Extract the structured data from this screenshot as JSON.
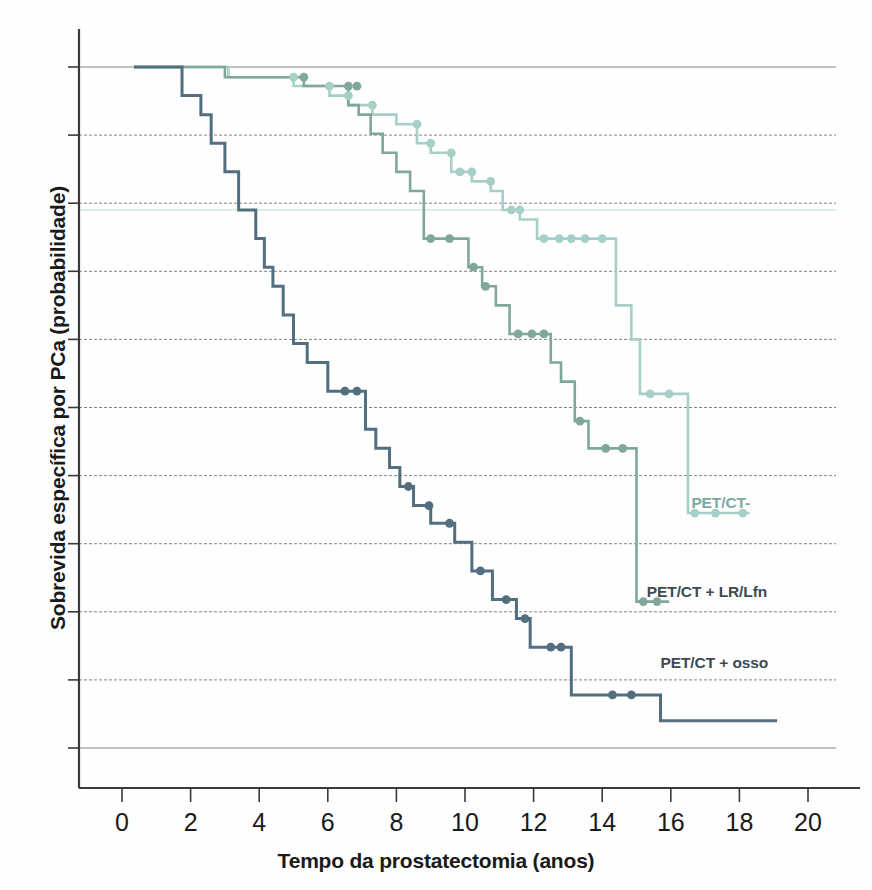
{
  "chart_data": {
    "type": "line",
    "title": "",
    "subtitle": "",
    "xlabel": "Tempo da prostatectomia (anos)",
    "ylabel": "Sobrevida específica por PCa (probabilidade)",
    "xlim": [
      -0.65,
      20.6
    ],
    "ylim": [
      0.0,
      1.06
    ],
    "xticks": [
      0,
      2,
      4,
      6,
      8,
      10,
      12,
      14,
      16,
      18,
      20
    ],
    "xtick_labels": [
      "0",
      "2",
      "4",
      "6",
      "8",
      "10",
      "12",
      "14",
      "16",
      "18",
      "20"
    ],
    "yticks": [
      0.0,
      0.1,
      0.2,
      0.3,
      0.4,
      0.5,
      0.6,
      0.7,
      0.8,
      0.9,
      1.0
    ],
    "ytick_labels": [
      "",
      "",
      "",
      "",
      "",
      "",
      "",
      "",
      "",
      "",
      ""
    ],
    "grid": true,
    "grid_style": "dashed-horizontal",
    "legend_position": "inline-right-of-curves",
    "curve_style": "kaplan-meier step function with censoring dots",
    "series": [
      {
        "name": "PET/CT-",
        "color": "#a6d0c7",
        "label_color": "#7ba99f",
        "label_x": 16.6,
        "label_y": 0.345,
        "points": [
          [
            0.35,
            1.0
          ],
          [
            3.1,
            1.0
          ],
          [
            3.1,
            0.985
          ],
          [
            5.0,
            0.985
          ],
          [
            5.0,
            0.972
          ],
          [
            6.05,
            0.972
          ],
          [
            6.05,
            0.958
          ],
          [
            6.6,
            0.958
          ],
          [
            6.6,
            0.944
          ],
          [
            7.3,
            0.944
          ],
          [
            7.3,
            0.93
          ],
          [
            8.0,
            0.93
          ],
          [
            8.0,
            0.916
          ],
          [
            8.6,
            0.916
          ],
          [
            8.6,
            0.888
          ],
          [
            9.0,
            0.888
          ],
          [
            9.0,
            0.874
          ],
          [
            9.6,
            0.874
          ],
          [
            9.6,
            0.846
          ],
          [
            10.2,
            0.846
          ],
          [
            10.2,
            0.832
          ],
          [
            10.75,
            0.832
          ],
          [
            10.75,
            0.818
          ],
          [
            11.1,
            0.818
          ],
          [
            11.1,
            0.79
          ],
          [
            11.6,
            0.79
          ],
          [
            11.6,
            0.776
          ],
          [
            12.1,
            0.776
          ],
          [
            12.1,
            0.748
          ],
          [
            14.4,
            0.748
          ],
          [
            14.4,
            0.65
          ],
          [
            14.85,
            0.65
          ],
          [
            14.85,
            0.6
          ],
          [
            15.1,
            0.6
          ],
          [
            15.1,
            0.52
          ],
          [
            16.5,
            0.52
          ],
          [
            16.5,
            0.345
          ],
          [
            18.3,
            0.345
          ]
        ],
        "censor_marks": [
          [
            5.0,
            0.985
          ],
          [
            6.05,
            0.972
          ],
          [
            6.6,
            0.958
          ],
          [
            7.3,
            0.944
          ],
          [
            8.6,
            0.916
          ],
          [
            9.0,
            0.888
          ],
          [
            9.6,
            0.874
          ],
          [
            9.85,
            0.846
          ],
          [
            10.2,
            0.846
          ],
          [
            10.75,
            0.832
          ],
          [
            11.35,
            0.79
          ],
          [
            11.6,
            0.79
          ],
          [
            12.3,
            0.748
          ],
          [
            12.75,
            0.748
          ],
          [
            13.1,
            0.748
          ],
          [
            13.5,
            0.748
          ],
          [
            14.0,
            0.748
          ],
          [
            15.4,
            0.52
          ],
          [
            15.95,
            0.52
          ],
          [
            16.7,
            0.345
          ],
          [
            17.3,
            0.345
          ],
          [
            18.1,
            0.345
          ]
        ]
      },
      {
        "name": "PET/CT + LR/Lfn",
        "color": "#7fa79b",
        "label_color": "#3c4a52",
        "label_x": 15.3,
        "label_y": 0.215,
        "points": [
          [
            0.35,
            1.0
          ],
          [
            3.0,
            1.0
          ],
          [
            3.0,
            0.985
          ],
          [
            5.3,
            0.985
          ],
          [
            5.3,
            0.972
          ],
          [
            6.6,
            0.972
          ],
          [
            6.6,
            0.944
          ],
          [
            6.9,
            0.944
          ],
          [
            6.9,
            0.93
          ],
          [
            7.25,
            0.93
          ],
          [
            7.25,
            0.902
          ],
          [
            7.6,
            0.902
          ],
          [
            7.6,
            0.874
          ],
          [
            8.0,
            0.874
          ],
          [
            8.0,
            0.846
          ],
          [
            8.4,
            0.846
          ],
          [
            8.4,
            0.818
          ],
          [
            8.8,
            0.818
          ],
          [
            8.8,
            0.748
          ],
          [
            10.1,
            0.748
          ],
          [
            10.1,
            0.706
          ],
          [
            10.5,
            0.706
          ],
          [
            10.5,
            0.678
          ],
          [
            10.9,
            0.678
          ],
          [
            10.9,
            0.65
          ],
          [
            11.3,
            0.65
          ],
          [
            11.3,
            0.608
          ],
          [
            12.5,
            0.608
          ],
          [
            12.5,
            0.566
          ],
          [
            12.8,
            0.566
          ],
          [
            12.8,
            0.538
          ],
          [
            13.2,
            0.538
          ],
          [
            13.2,
            0.48
          ],
          [
            13.6,
            0.48
          ],
          [
            13.6,
            0.44
          ],
          [
            15.0,
            0.44
          ],
          [
            15.0,
            0.215
          ],
          [
            15.95,
            0.215
          ]
        ],
        "censor_marks": [
          [
            5.3,
            0.985
          ],
          [
            6.6,
            0.972
          ],
          [
            6.85,
            0.972
          ],
          [
            9.0,
            0.748
          ],
          [
            9.55,
            0.748
          ],
          [
            10.25,
            0.706
          ],
          [
            10.6,
            0.678
          ],
          [
            11.55,
            0.608
          ],
          [
            11.95,
            0.608
          ],
          [
            12.3,
            0.608
          ],
          [
            13.35,
            0.48
          ],
          [
            14.1,
            0.44
          ],
          [
            14.6,
            0.44
          ],
          [
            15.2,
            0.215
          ],
          [
            15.6,
            0.215
          ]
        ]
      },
      {
        "name": "PET/CT + osso",
        "color": "#536e7f",
        "label_color": "#3c4a52",
        "label_x": 15.7,
        "label_y": 0.11,
        "points": [
          [
            0.35,
            1.0
          ],
          [
            1.75,
            1.0
          ],
          [
            1.75,
            0.958
          ],
          [
            2.3,
            0.958
          ],
          [
            2.3,
            0.93
          ],
          [
            2.6,
            0.93
          ],
          [
            2.6,
            0.888
          ],
          [
            3.0,
            0.888
          ],
          [
            3.0,
            0.846
          ],
          [
            3.4,
            0.846
          ],
          [
            3.4,
            0.79
          ],
          [
            3.9,
            0.79
          ],
          [
            3.9,
            0.748
          ],
          [
            4.15,
            0.748
          ],
          [
            4.15,
            0.706
          ],
          [
            4.4,
            0.706
          ],
          [
            4.4,
            0.678
          ],
          [
            4.7,
            0.678
          ],
          [
            4.7,
            0.636
          ],
          [
            5.0,
            0.636
          ],
          [
            5.0,
            0.594
          ],
          [
            5.4,
            0.594
          ],
          [
            5.4,
            0.566
          ],
          [
            6.0,
            0.566
          ],
          [
            6.0,
            0.524
          ],
          [
            7.1,
            0.524
          ],
          [
            7.1,
            0.468
          ],
          [
            7.4,
            0.468
          ],
          [
            7.4,
            0.44
          ],
          [
            7.8,
            0.44
          ],
          [
            7.8,
            0.412
          ],
          [
            8.1,
            0.412
          ],
          [
            8.1,
            0.384
          ],
          [
            8.5,
            0.384
          ],
          [
            8.5,
            0.356
          ],
          [
            9.0,
            0.356
          ],
          [
            9.0,
            0.33
          ],
          [
            9.7,
            0.33
          ],
          [
            9.7,
            0.302
          ],
          [
            10.2,
            0.302
          ],
          [
            10.2,
            0.26
          ],
          [
            10.8,
            0.26
          ],
          [
            10.8,
            0.218
          ],
          [
            11.5,
            0.218
          ],
          [
            11.5,
            0.19
          ],
          [
            11.9,
            0.19
          ],
          [
            11.9,
            0.148
          ],
          [
            13.1,
            0.148
          ],
          [
            13.1,
            0.078
          ],
          [
            15.7,
            0.078
          ],
          [
            15.7,
            0.04
          ],
          [
            19.1,
            0.04
          ]
        ],
        "censor_marks": [
          [
            6.5,
            0.524
          ],
          [
            6.85,
            0.524
          ],
          [
            8.35,
            0.384
          ],
          [
            8.95,
            0.356
          ],
          [
            9.55,
            0.33
          ],
          [
            10.45,
            0.26
          ],
          [
            11.2,
            0.218
          ],
          [
            11.75,
            0.19
          ],
          [
            12.5,
            0.148
          ],
          [
            12.8,
            0.148
          ],
          [
            14.3,
            0.078
          ],
          [
            14.85,
            0.078
          ]
        ]
      }
    ],
    "highlight_line": {
      "y": 0.79,
      "color": "#cfe8e2",
      "note": "pale teal horizontal rule across plot"
    }
  },
  "axes": {
    "x_tick_labels": [
      "0",
      "2",
      "4",
      "6",
      "8",
      "10",
      "12",
      "14",
      "16",
      "18",
      "20"
    ],
    "x_axis_title": "Tempo da prostatectomia (anos)",
    "y_axis_title": "Sobrevida específica por PCa (probabilidade)"
  },
  "series_labels": [
    {
      "text": "PET/CT-",
      "x": 16.6,
      "y": 0.345
    },
    {
      "text": "PET/CT + LR/Lfn",
      "x": 15.3,
      "y": 0.215
    },
    {
      "text": "PET/CT + osso",
      "x": 15.7,
      "y": 0.11
    }
  ],
  "colors": {
    "light_green": "#a6d0c7",
    "mid_green": "#7fa79b",
    "dark_blue": "#536e7f",
    "grid": "#555555",
    "axis": "#3a3a3a",
    "text": "#1a1a1a",
    "background": "#fefefe"
  }
}
